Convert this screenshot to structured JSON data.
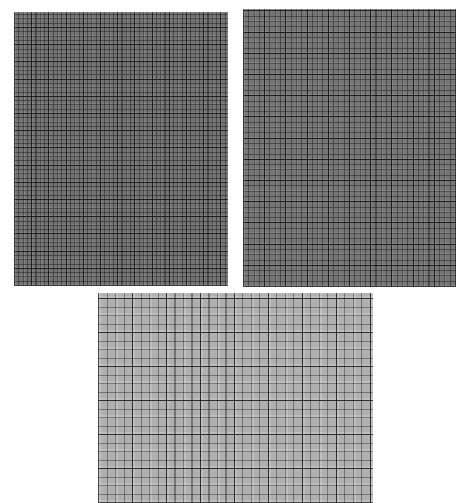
{
  "figure": {
    "title": "",
    "background_color": "#ffffff",
    "width": 463,
    "height": 503,
    "panel_count": 3,
    "layout": "two-panels-top-one-panel-bottom-centered",
    "caption": ""
  },
  "chart_data": {
    "type": "heatmap",
    "title": "",
    "subtitle": "",
    "xlabel": "",
    "ylabel": "",
    "grid": true,
    "legend": "none",
    "panels": [
      {
        "id": "panel-a",
        "position": "top-left",
        "x": 14,
        "y": 12,
        "width": 214,
        "height": 274,
        "base_gray": "#737373",
        "minor_spacing_px": 4.3,
        "major_spacing_px": 17.2,
        "minor_cells_x": 50,
        "minor_cells_y": 64,
        "major_cells_x": 12,
        "major_cells_y": 16,
        "minor_line_color": "#232323",
        "major_line_color": "#141414",
        "mean_intensity": 0.45,
        "label": ""
      },
      {
        "id": "panel-b",
        "position": "top-right",
        "x": 243,
        "y": 9,
        "width": 213,
        "height": 278,
        "base_gray": "#767676",
        "minor_spacing_px": 5.3,
        "major_spacing_px": 21.2,
        "minor_cells_x": 40,
        "minor_cells_y": 52,
        "major_cells_x": 10,
        "major_cells_y": 13,
        "minor_line_color": "#202020",
        "major_line_color": "#121212",
        "mean_intensity": 0.46,
        "label": ""
      },
      {
        "id": "panel-c",
        "position": "bottom-center",
        "x": 98,
        "y": 293,
        "width": 275,
        "height": 210,
        "base_gray": "#b0b0b0",
        "minor_spacing_px": 8.5,
        "major_spacing_px": 34,
        "minor_cells_x": 32,
        "minor_cells_y": 25,
        "major_cells_x": 8,
        "major_cells_y": 6,
        "minor_line_color": "#282828",
        "major_line_color": "#191919",
        "mean_intensity": 0.69,
        "label": ""
      }
    ]
  }
}
